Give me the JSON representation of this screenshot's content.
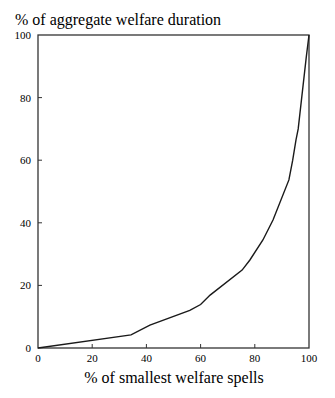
{
  "chart_data": {
    "type": "line",
    "title": "",
    "ylabel": "% of aggregate welfare duration",
    "xlabel": "% of smallest welfare spells",
    "xlim": [
      0,
      100
    ],
    "ylim": [
      0,
      100
    ],
    "xticks": [
      0,
      20,
      40,
      60,
      80,
      100
    ],
    "yticks": [
      0,
      20,
      40,
      60,
      80,
      100
    ],
    "grid": false,
    "legend": null,
    "series": [
      {
        "name": "Cumulative share of welfare duration",
        "color": "#1a1a1a",
        "x": [
          0,
          34.3,
          41.3,
          56.0,
          60.0,
          63.5,
          75.3,
          78.2,
          83.0,
          86.7,
          92.6,
          94.0,
          95.2,
          96.0,
          99.0,
          100
        ],
        "y": [
          0,
          4.2,
          7.3,
          12.0,
          13.9,
          16.9,
          24.9,
          28.1,
          34.5,
          40.9,
          53.7,
          60.0,
          66.5,
          70.0,
          93.0,
          100
        ]
      }
    ]
  },
  "labels": {
    "ylabel": "% of aggregate welfare duration",
    "xlabel": "% of smallest welfare spells"
  },
  "colors": {
    "line": "#1a1a1a",
    "axis": "#333333",
    "background": "#ffffff"
  }
}
